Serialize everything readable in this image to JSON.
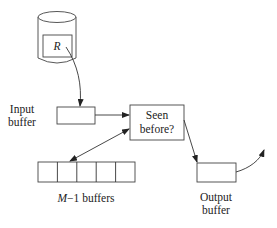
{
  "disk": {
    "label": "R"
  },
  "input_buffer": {
    "label_line1": "Input",
    "label_line2": "buffer"
  },
  "check": {
    "label_line1": "Seen",
    "label_line2": "before?"
  },
  "buffers": {
    "count": 5,
    "label_var": "M",
    "label_rest": "−1 buffers"
  },
  "output_buffer": {
    "label_line1": "Output",
    "label_line2": "buffer"
  },
  "colors": {
    "stroke": "#333333",
    "background": "#ffffff"
  }
}
